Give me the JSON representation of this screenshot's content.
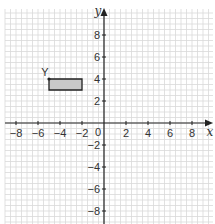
{
  "chart_data": {
    "type": "scatter",
    "title": "",
    "xlabel": "x",
    "ylabel": "y",
    "xlim": [
      -9,
      9
    ],
    "ylim": [
      -9,
      10
    ],
    "grid": true,
    "x_ticks": [
      -8,
      -6,
      -4,
      -2,
      2,
      4,
      6,
      8
    ],
    "y_ticks": [
      8,
      6,
      4,
      2,
      -2,
      -4,
      -6,
      -8
    ],
    "origin_label": "0",
    "shapes": [
      {
        "type": "rectangle",
        "name": "shaded-rectangle",
        "vertices": [
          [
            -5,
            4
          ],
          [
            -2,
            4
          ],
          [
            -2,
            3
          ],
          [
            -5,
            3
          ]
        ],
        "fill": "#c8c8c8",
        "stroke": "#222222"
      }
    ],
    "points": [
      {
        "label": "Y",
        "x": -5,
        "y": 4
      }
    ]
  },
  "style": {
    "grid_color": "#d9d9d9",
    "axis_color": "#222222",
    "text_color": "#333333"
  }
}
